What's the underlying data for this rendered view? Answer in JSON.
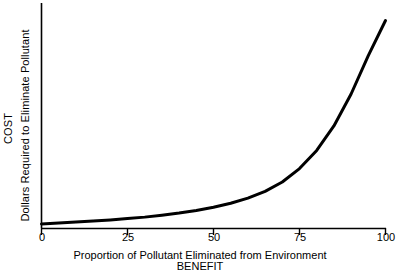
{
  "chart_data": {
    "type": "line",
    "title": "",
    "xlabel": "Proportion of Pollutant Eliminated from Environment",
    "xlabel_secondary": "BENEFIT",
    "ylabel": "COST",
    "ylabel_secondary": "Dollars Required to Eliminate Pollutant",
    "xlim": [
      0,
      100
    ],
    "ylim": [
      0,
      100
    ],
    "grid": false,
    "legend": false,
    "x_ticks": [
      "0",
      "25",
      "50",
      "75",
      "100"
    ],
    "x_tick_values": [
      0,
      25,
      50,
      75,
      100
    ],
    "y_ticks": [],
    "series": [
      {
        "name": "Cost of pollutant elimination",
        "x": [
          0,
          5,
          10,
          15,
          20,
          25,
          30,
          35,
          40,
          45,
          50,
          55,
          60,
          65,
          70,
          75,
          80,
          85,
          90,
          95,
          100
        ],
        "values": [
          0.5,
          0.9,
          1.4,
          1.9,
          2.4,
          3.0,
          3.7,
          4.6,
          5.6,
          6.8,
          8.3,
          10.2,
          12.6,
          15.8,
          20.2,
          26.5,
          35.0,
          46.5,
          61.5,
          79.5,
          96.0
        ]
      }
    ],
    "line_color": "#000000",
    "line_width": 3,
    "axis_color": "#000000",
    "background": "#ffffff"
  },
  "axes": {
    "tick_labels": {
      "t0": "0",
      "t1": "25",
      "t2": "50",
      "t3": "75",
      "t4": "100"
    }
  }
}
